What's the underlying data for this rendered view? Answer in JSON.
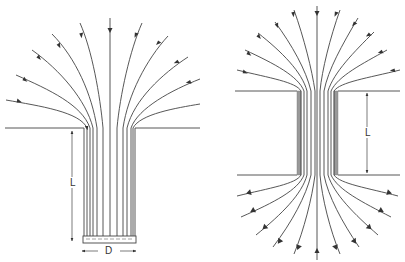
{
  "figures": [
    {
      "id": "left",
      "description": "Streamlines converging into a tube of length L and diameter D closed at the bottom",
      "labels": {
        "length": "L",
        "diameter": "D"
      }
    },
    {
      "id": "right",
      "description": "Streamlines converging into and diverging out of a through-channel of length L",
      "labels": {
        "length": "L"
      }
    }
  ],
  "colors": {
    "line": "#444444",
    "background": "#ffffff"
  }
}
